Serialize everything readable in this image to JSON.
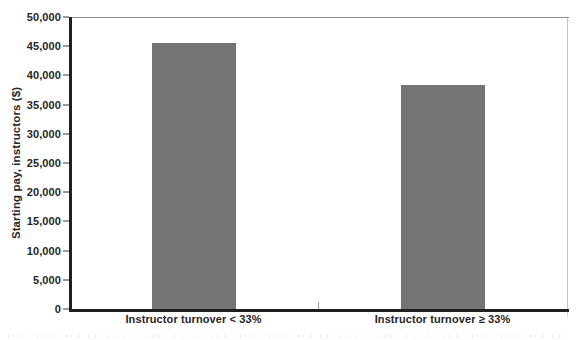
{
  "chart_data": {
    "type": "bar",
    "title": "",
    "categories": [
      "Instructor turnover < 33%",
      "Instructor turnover ≥ 33%"
    ],
    "values": [
      45500,
      38400
    ],
    "xlabel": "",
    "ylabel": "Starting pay, instructors ($)",
    "ylim": [
      0,
      50000
    ],
    "ytick_step": 5000,
    "ytick_labels": [
      "0",
      "5,000",
      "10,000",
      "15,000",
      "20,000",
      "25,000",
      "30,000",
      "35,000",
      "40,000",
      "45,000",
      "50,000"
    ],
    "legend": "none",
    "grid": false,
    "colors": {
      "bar": "#747474",
      "axis": "#1f1f1f",
      "tick": "#9a9a9a",
      "frame_top": "#8f8f8f",
      "frame_right": "#c6c6c6",
      "text": "#262626"
    }
  }
}
